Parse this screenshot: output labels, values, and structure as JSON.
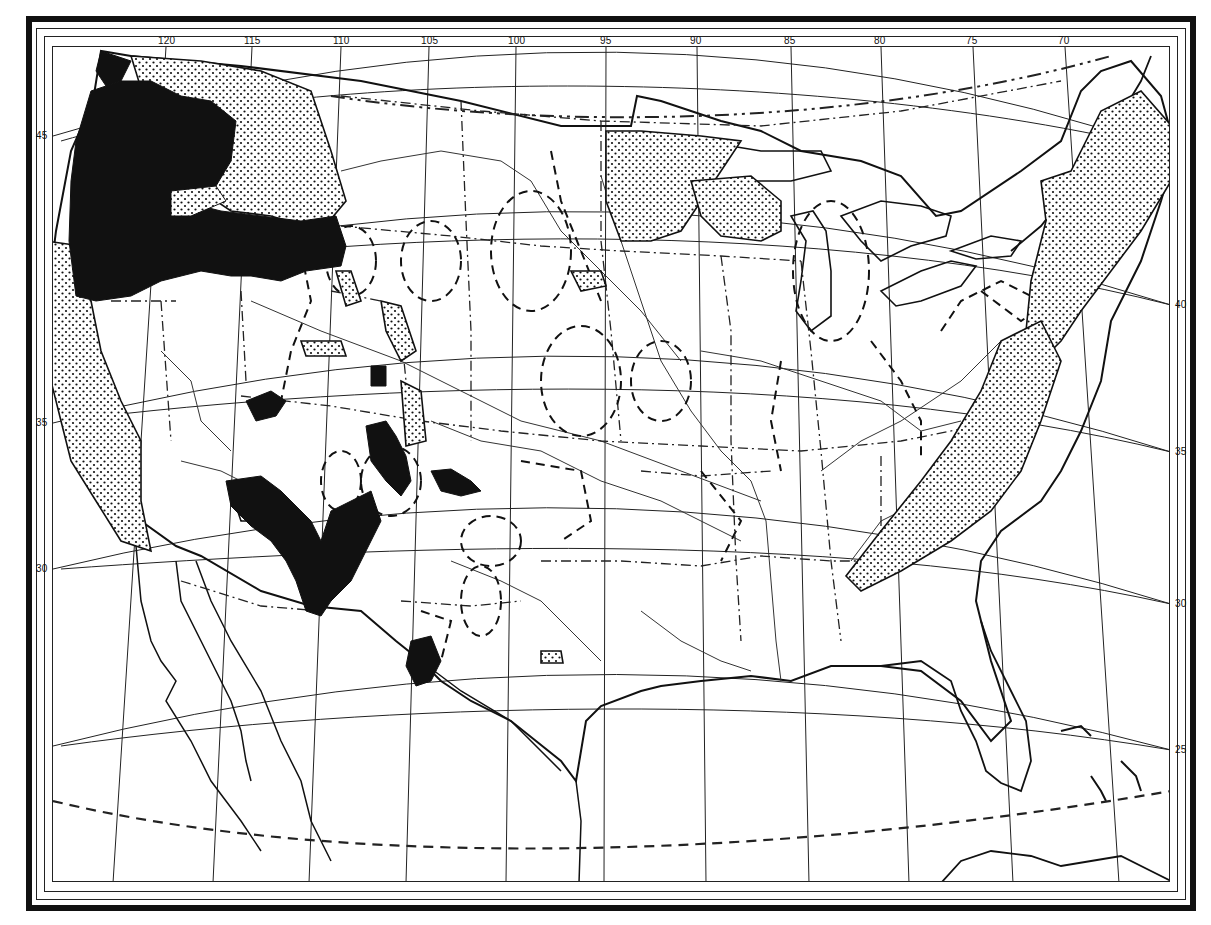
{
  "map": {
    "longitude_ticks": [
      {
        "label": "120",
        "x": 165
      },
      {
        "label": "115",
        "x": 251
      },
      {
        "label": "110",
        "x": 340
      },
      {
        "label": "105",
        "x": 428
      },
      {
        "label": "100",
        "x": 515
      },
      {
        "label": "95",
        "x": 605
      },
      {
        "label": "90",
        "x": 696
      },
      {
        "label": "85",
        "x": 790
      },
      {
        "label": "80",
        "x": 880
      },
      {
        "label": "75",
        "x": 972
      },
      {
        "label": "70",
        "x": 1064
      }
    ],
    "latitude_ticks_left": [
      {
        "label": "45",
        "y": 135
      },
      {
        "label": "35",
        "y": 422
      },
      {
        "label": "30",
        "y": 568
      }
    ],
    "latitude_ticks_right": [
      {
        "label": "40",
        "y": 304
      },
      {
        "label": "35",
        "y": 451
      },
      {
        "label": "30",
        "y": 603
      },
      {
        "label": "25",
        "y": 749
      }
    ],
    "legend_symbols": [
      {
        "name": "solid-black-region",
        "color": "#111111"
      },
      {
        "name": "stippled-region",
        "color": "#111111"
      },
      {
        "name": "dashed-contour",
        "color": "#222222"
      },
      {
        "name": "dash-dot-boundary",
        "color": "#222222"
      }
    ]
  }
}
